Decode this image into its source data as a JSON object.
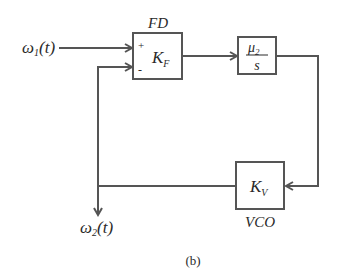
{
  "diagram": {
    "type": "block-diagram",
    "caption": "(b)",
    "input": {
      "symbol": "ω",
      "subscript": "1",
      "arg": "(t)"
    },
    "output": {
      "symbol": "ω",
      "subscript": "2",
      "arg": "(t)"
    },
    "blocks": [
      {
        "id": "fd",
        "title": "FD",
        "gain_symbol": "K",
        "gain_subscript": "F",
        "plus_sign": "+",
        "minus_sign": "-"
      },
      {
        "id": "integrator",
        "numerator_symbol": "μ",
        "numerator_subscript": "2",
        "denominator": "s"
      },
      {
        "id": "vco",
        "title": "VCO",
        "gain_symbol": "K",
        "gain_subscript": "V"
      }
    ],
    "connections": [
      {
        "from": "input",
        "to": "fd",
        "port": "+"
      },
      {
        "from": "fd",
        "to": "integrator"
      },
      {
        "from": "integrator",
        "to": "vco"
      },
      {
        "from": "vco",
        "to": "fd",
        "port": "-"
      },
      {
        "from": "vco",
        "to": "output"
      }
    ],
    "colors": {
      "line": "#555555",
      "text": "#2a2a2a",
      "background": "#ffffff"
    }
  }
}
